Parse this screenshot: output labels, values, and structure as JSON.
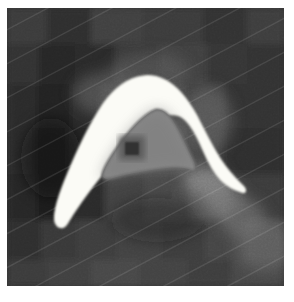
{
  "viewer": {
    "kind": "grayscale-image-with-segmentation-overlay",
    "width": 294,
    "height": 302,
    "page_background": "#ffffff",
    "image_frame": {
      "x": 7,
      "y": 8,
      "width": 277,
      "height": 278
    },
    "alt_text": "Pixelated grayscale image with a bright white A-shaped segmentation region and an inner gray contour containing a dark spot"
  },
  "palette": {
    "page_white": "#ffffff",
    "segmentation_fill": "#fbfbf6",
    "segmentation_edge": "#f2f2ec",
    "inner_contour_stroke": "#6e6e6e",
    "inner_region_fill": "#8b8b8b",
    "inner_region_fill_dark": "#6f6f6f",
    "dark_spot": "#303030",
    "background_dark": "#303030",
    "background_mid": "#474747",
    "background_light": "#6d6d6d",
    "background_lightest": "#8e8e8e",
    "background_darkest": "#1c1c1c"
  },
  "background_blocks": [
    {
      "x": 0,
      "y": 0,
      "w": 40,
      "h": 36,
      "tone": "#3b3b3b"
    },
    {
      "x": 40,
      "y": 0,
      "w": 44,
      "h": 36,
      "tone": "#2e2e2e"
    },
    {
      "x": 84,
      "y": 0,
      "w": 52,
      "h": 36,
      "tone": "#414141"
    },
    {
      "x": 136,
      "y": 0,
      "w": 60,
      "h": 36,
      "tone": "#3a3a3a"
    },
    {
      "x": 196,
      "y": 0,
      "w": 44,
      "h": 36,
      "tone": "#333333"
    },
    {
      "x": 240,
      "y": 0,
      "w": 37,
      "h": 36,
      "tone": "#3d3d3d"
    },
    {
      "x": 0,
      "y": 36,
      "w": 32,
      "h": 40,
      "tone": "#333333"
    },
    {
      "x": 32,
      "y": 36,
      "w": 36,
      "h": 40,
      "tone": "#282828"
    },
    {
      "x": 68,
      "y": 36,
      "w": 40,
      "h": 40,
      "tone": "#2b2b2b"
    },
    {
      "x": 108,
      "y": 36,
      "w": 44,
      "h": 40,
      "tone": "#383838"
    },
    {
      "x": 152,
      "y": 36,
      "w": 48,
      "h": 40,
      "tone": "#414141"
    },
    {
      "x": 200,
      "y": 36,
      "w": 40,
      "h": 40,
      "tone": "#363636"
    },
    {
      "x": 240,
      "y": 36,
      "w": 37,
      "h": 40,
      "tone": "#303030"
    },
    {
      "x": 0,
      "y": 76,
      "w": 30,
      "h": 44,
      "tone": "#2c2c2c"
    },
    {
      "x": 30,
      "y": 76,
      "w": 34,
      "h": 44,
      "tone": "#242424"
    },
    {
      "x": 64,
      "y": 76,
      "w": 30,
      "h": 44,
      "tone": "#2a2a2a"
    },
    {
      "x": 94,
      "y": 76,
      "w": 34,
      "h": 44,
      "tone": "#3f3f3f"
    },
    {
      "x": 128,
      "y": 76,
      "w": 50,
      "h": 44,
      "tone": "#4b4b4b"
    },
    {
      "x": 178,
      "y": 76,
      "w": 40,
      "h": 44,
      "tone": "#3c3c3c"
    },
    {
      "x": 218,
      "y": 76,
      "w": 59,
      "h": 44,
      "tone": "#303030"
    },
    {
      "x": 0,
      "y": 120,
      "w": 28,
      "h": 46,
      "tone": "#2a2a2a"
    },
    {
      "x": 28,
      "y": 120,
      "w": 32,
      "h": 46,
      "tone": "#1f1f1f"
    },
    {
      "x": 60,
      "y": 120,
      "w": 28,
      "h": 46,
      "tone": "#262626"
    },
    {
      "x": 88,
      "y": 120,
      "w": 36,
      "h": 46,
      "tone": "#3a3a3a"
    },
    {
      "x": 124,
      "y": 120,
      "w": 54,
      "h": 46,
      "tone": "#4f4f4f"
    },
    {
      "x": 178,
      "y": 120,
      "w": 38,
      "h": 46,
      "tone": "#3b3b3b"
    },
    {
      "x": 216,
      "y": 120,
      "w": 61,
      "h": 46,
      "tone": "#2d2d2d"
    },
    {
      "x": 0,
      "y": 166,
      "w": 30,
      "h": 46,
      "tone": "#272727"
    },
    {
      "x": 30,
      "y": 166,
      "w": 34,
      "h": 46,
      "tone": "#1d1d1d"
    },
    {
      "x": 64,
      "y": 166,
      "w": 34,
      "h": 46,
      "tone": "#2b2b2b"
    },
    {
      "x": 98,
      "y": 166,
      "w": 40,
      "h": 46,
      "tone": "#434343"
    },
    {
      "x": 138,
      "y": 166,
      "w": 44,
      "h": 46,
      "tone": "#4a4a4a"
    },
    {
      "x": 182,
      "y": 166,
      "w": 40,
      "h": 46,
      "tone": "#555555"
    },
    {
      "x": 222,
      "y": 166,
      "w": 55,
      "h": 46,
      "tone": "#3a3a3a"
    },
    {
      "x": 0,
      "y": 212,
      "w": 34,
      "h": 40,
      "tone": "#2f2f2f"
    },
    {
      "x": 34,
      "y": 212,
      "w": 36,
      "h": 40,
      "tone": "#383838"
    },
    {
      "x": 70,
      "y": 212,
      "w": 40,
      "h": 40,
      "tone": "#3e3e3e"
    },
    {
      "x": 110,
      "y": 212,
      "w": 44,
      "h": 40,
      "tone": "#434343"
    },
    {
      "x": 154,
      "y": 212,
      "w": 44,
      "h": 40,
      "tone": "#3c3c3c"
    },
    {
      "x": 198,
      "y": 212,
      "w": 40,
      "h": 40,
      "tone": "#454545"
    },
    {
      "x": 238,
      "y": 212,
      "w": 39,
      "h": 40,
      "tone": "#4d4d4d"
    },
    {
      "x": 0,
      "y": 252,
      "w": 40,
      "h": 26,
      "tone": "#3a3a3a"
    },
    {
      "x": 40,
      "y": 252,
      "w": 44,
      "h": 26,
      "tone": "#414141"
    },
    {
      "x": 84,
      "y": 252,
      "w": 48,
      "h": 26,
      "tone": "#464646"
    },
    {
      "x": 132,
      "y": 252,
      "w": 48,
      "h": 26,
      "tone": "#424242"
    },
    {
      "x": 180,
      "y": 252,
      "w": 44,
      "h": 26,
      "tone": "#3e3e3e"
    },
    {
      "x": 224,
      "y": 252,
      "w": 53,
      "h": 26,
      "tone": "#474747"
    }
  ],
  "bright_streaks": [
    {
      "name": "upper-halo-left",
      "cx": 100,
      "cy": 86,
      "rx": 34,
      "ry": 22,
      "tone": "#6a6a6a",
      "opacity": 0.55
    },
    {
      "name": "upper-halo-apex",
      "cx": 142,
      "cy": 64,
      "rx": 40,
      "ry": 20,
      "tone": "#656565",
      "opacity": 0.45
    },
    {
      "name": "right-halo",
      "cx": 200,
      "cy": 112,
      "rx": 26,
      "ry": 34,
      "tone": "#707070",
      "opacity": 0.5
    },
    {
      "name": "tail-band-upper",
      "cx": 198,
      "cy": 172,
      "rx": 22,
      "ry": 16,
      "tone": "#8a8a8a",
      "opacity": 0.75
    },
    {
      "name": "tail-band-mid",
      "cx": 216,
      "cy": 190,
      "rx": 20,
      "ry": 18,
      "tone": "#828282",
      "opacity": 0.7
    },
    {
      "name": "tail-band-lower",
      "cx": 236,
      "cy": 210,
      "rx": 22,
      "ry": 20,
      "tone": "#767676",
      "opacity": 0.6
    },
    {
      "name": "bottom-right-glow",
      "cx": 258,
      "cy": 238,
      "rx": 30,
      "ry": 26,
      "tone": "#6e6e6e",
      "opacity": 0.5
    },
    {
      "name": "left-shadow",
      "cx": 44,
      "cy": 150,
      "rx": 30,
      "ry": 40,
      "tone": "#141414",
      "opacity": 0.55
    },
    {
      "name": "interior-shadow",
      "cx": 150,
      "cy": 212,
      "rx": 46,
      "ry": 22,
      "tone": "#1e1e1e",
      "opacity": 0.35
    }
  ],
  "segmentation": {
    "outer_label": "bright-a-shaped-region",
    "outer_path": "M 136 68 C 120 70 106 82 96 96 C 84 114 70 142 58 172 C 50 192 46 206 48 214 C 50 220 56 222 60 216 C 66 206 78 188 94 168 C 112 146 130 126 146 114 C 158 106 168 104 176 110 C 184 116 190 128 196 142 C 202 156 208 166 214 172 C 220 178 228 182 234 184 C 239 186 240 182 236 178 C 230 172 222 164 214 152 C 206 140 198 124 190 108 C 180 90 170 78 158 72 C 150 68 143 67 136 68 Z",
    "inner_label": "inner-dark-core-contour",
    "inner_path": "M 148 102 C 138 106 126 118 114 134 C 104 148 98 158 96 164 C 94 170 98 172 106 170 C 120 166 142 162 160 160 C 172 159 180 160 184 162 C 188 164 190 160 186 152 C 180 140 174 126 168 116 C 162 106 155 100 148 102 Z",
    "dark_spot_label": "dark-focal-spot",
    "dark_spot": {
      "x": 118,
      "y": 134,
      "w": 14,
      "h": 13
    },
    "dark_spot_halo": {
      "x": 112,
      "y": 128,
      "w": 26,
      "h": 24
    }
  }
}
